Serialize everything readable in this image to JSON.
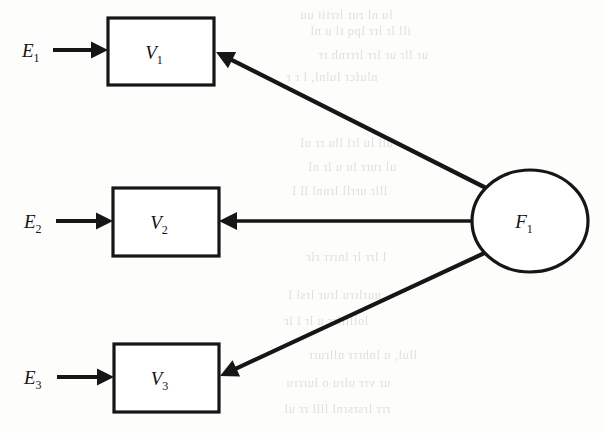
{
  "figure": {
    "type": "path-diagram",
    "background_color": "#fdfdfc",
    "ink_color": "#161616"
  },
  "latent": {
    "id": "F1",
    "shape": "circle",
    "label": "F",
    "subscript": "1",
    "cx": 530,
    "cy": 221,
    "rx": 58,
    "ry": 51
  },
  "indicators": [
    {
      "id": "V1",
      "shape": "rect",
      "label": "V",
      "subscript": "1",
      "x": 108,
      "y": 18,
      "width": 106,
      "height": 67
    },
    {
      "id": "V2",
      "shape": "rect",
      "label": "V",
      "subscript": "2",
      "x": 113,
      "y": 188,
      "width": 106,
      "height": 68
    },
    {
      "id": "V3",
      "shape": "rect",
      "label": "V",
      "subscript": "3",
      "x": 114,
      "y": 344,
      "width": 105,
      "height": 68
    }
  ],
  "errors": [
    {
      "id": "E1",
      "label": "E",
      "subscript": "1",
      "x": 22,
      "y": 57,
      "arrow": {
        "x1": 53,
        "y1": 50,
        "x2": 108,
        "y2": 50
      }
    },
    {
      "id": "E2",
      "label": "E",
      "subscript": "2",
      "x": 24,
      "y": 228,
      "arrow": {
        "x1": 56,
        "y1": 221,
        "x2": 113,
        "y2": 221
      }
    },
    {
      "id": "E3",
      "label": "E",
      "subscript": "3",
      "x": 24,
      "y": 384,
      "arrow": {
        "x1": 57,
        "y1": 377,
        "x2": 114,
        "y2": 377
      }
    }
  ],
  "loadings": [
    {
      "id": "F1-to-V1",
      "from": "F1",
      "to": "V1",
      "arrow": {
        "x1": 494,
        "y1": 192,
        "x2": 216,
        "y2": 52
      }
    },
    {
      "id": "F1-to-V2",
      "from": "F1",
      "to": "V2",
      "arrow": {
        "x1": 472,
        "y1": 221,
        "x2": 219,
        "y2": 221
      }
    },
    {
      "id": "F1-to-V3",
      "from": "F1",
      "to": "V3",
      "arrow": {
        "x1": 491,
        "y1": 250,
        "x2": 220,
        "y2": 376
      }
    }
  ],
  "ghost_text": {
    "note": "Faint show-through of printed text from the reverse side of the scanned page; illegible.",
    "lines": [
      {
        "text": "lu nl rur lrriii uu",
        "x": 300,
        "y": 8
      },
      {
        "text": "ill  lr lrr  lpq  tl  u  nl",
        "x": 310,
        "y": 24
      },
      {
        "text": "ur  llr ur  lrr lrrrnh   rr",
        "x": 318,
        "y": 48
      },
      {
        "text": "nlufcr     lulnl,      l  r  r",
        "x": 286,
        "y": 70
      },
      {
        "text": "ull  lu  lrl  llu  rr  ul",
        "x": 300,
        "y": 136
      },
      {
        "text": "ul  rurr  lu  u  lr  nl",
        "x": 308,
        "y": 160
      },
      {
        "text": "lllr  urrll  lrnnl  ll  l",
        "x": 292,
        "y": 184
      },
      {
        "text": "l  lrr  lr  lnrrr  rlr",
        "x": 306,
        "y": 250
      },
      {
        "text": "uurlrru lrur  lrsl  l",
        "x": 288,
        "y": 288
      },
      {
        "text": "lolllllrr  u  lr   l  lr",
        "x": 284,
        "y": 314
      },
      {
        "text": "llul,  u  lnhrrr  nllrurr",
        "x": 308,
        "y": 348
      },
      {
        "text": "ur  vrr  ulru  o  lurrru",
        "x": 286,
        "y": 376
      },
      {
        "text": "rrr  lrsrsrnl  llll  rr  ul",
        "x": 284,
        "y": 402
      }
    ]
  }
}
